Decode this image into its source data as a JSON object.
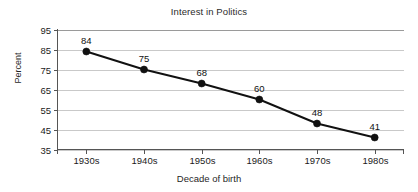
{
  "chart_data": {
    "type": "line",
    "title": "Interest in Politics",
    "xlabel": "Decade of birth",
    "ylabel": "Percent",
    "categories": [
      "1930s",
      "1940s",
      "1950s",
      "1960s",
      "1970s",
      "1980s"
    ],
    "values": [
      84,
      75,
      68,
      60,
      48,
      41
    ],
    "point_labels": [
      "84",
      "75",
      "68",
      "60",
      "48",
      "41"
    ],
    "ylim": [
      35,
      95
    ],
    "yticks": [
      35,
      45,
      55,
      65,
      75,
      85,
      95
    ],
    "ytick_labels": [
      "35",
      "45",
      "55",
      "65",
      "75",
      "85",
      "95"
    ],
    "grid": true,
    "legend": false,
    "series": [
      {
        "name": "Interest in Politics",
        "values": [
          84,
          75,
          68,
          60,
          48,
          41
        ],
        "color": "#111111",
        "marker": "circle"
      }
    ],
    "colors": {
      "background": "#ffffff",
      "line": "#111111",
      "marker": "#111111",
      "gridline": "#c9c9c9",
      "axis": "#555555",
      "text": "#1a1a1a"
    }
  }
}
